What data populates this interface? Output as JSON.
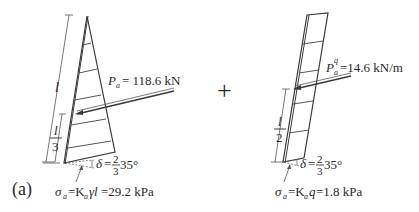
{
  "figure": {
    "panel_label": "(a)",
    "operator": "+",
    "colors": {
      "line": "#3a3a3a",
      "text": "#2a2a2a",
      "background": "#ffffff"
    }
  },
  "left_diagram": {
    "title": "Earth pressure due to soil weight",
    "shape": "triangle",
    "height_label": "l",
    "resultant_height": {
      "numerator": "l",
      "denominator": "3"
    },
    "force": {
      "symbol": "P",
      "subscript": "a",
      "equals": "= 118.6 kN"
    },
    "wall_friction": {
      "symbol": "δ",
      "eq": "=",
      "numerator": "2",
      "denominator": "3",
      "value": "35°"
    },
    "base_pressure": {
      "sigma": "σ",
      "sigma_sub": "a",
      "expr_prefix": "=K",
      "k_sub": "a",
      "expr_mid": "γl",
      "value": "=29.2 kPa"
    }
  },
  "right_diagram": {
    "title": "Earth pressure due to surcharge",
    "shape": "rectangle",
    "resultant_height": {
      "numerator": "l",
      "denominator": "2"
    },
    "force": {
      "symbol": "P",
      "subscript": "a",
      "superscript": "q",
      "equals": "=14.6 kN/m"
    },
    "wall_friction": {
      "symbol": "δ",
      "eq": "=",
      "numerator": "2",
      "denominator": "3",
      "value": "35°"
    },
    "base_pressure": {
      "sigma": "σ",
      "sigma_sub": "a",
      "expr_prefix": "=K",
      "k_sub": "a",
      "expr_mid": "q",
      "value": "=1.8 kPa"
    }
  }
}
